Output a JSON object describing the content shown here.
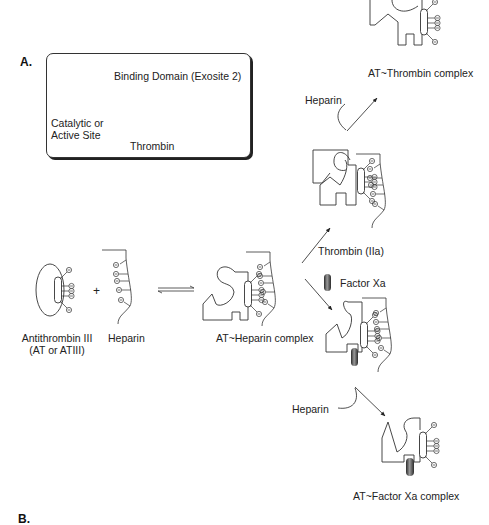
{
  "panels": {
    "a": "A.",
    "b": "B."
  },
  "legend": {
    "binding_domain": "Binding Domain (Exosite 2)",
    "catalytic_line1": "Catalytic or",
    "catalytic_line2": "Active Site",
    "name": "Thrombin"
  },
  "reactants": {
    "antithrombin_line1": "Antithrombin III",
    "antithrombin_line2": "(AT or ATIII)",
    "plus": "+",
    "heparin": "Heparin"
  },
  "complexes": {
    "at_heparin": "AT~Heparin complex",
    "at_thrombin": "AT~Thrombin complex",
    "at_factor_xa": "AT~Factor Xa complex"
  },
  "arrows": {
    "thrombin_label": "Thrombin (IIa)",
    "factor_xa_label": "Factor Xa",
    "heparin_release_top": "Heparin",
    "heparin_release_bottom": "Heparin"
  },
  "colors": {
    "line": "#333333",
    "factor_xa_dark": "#2a2a2a",
    "factor_xa_light": "#9a9a9a"
  }
}
